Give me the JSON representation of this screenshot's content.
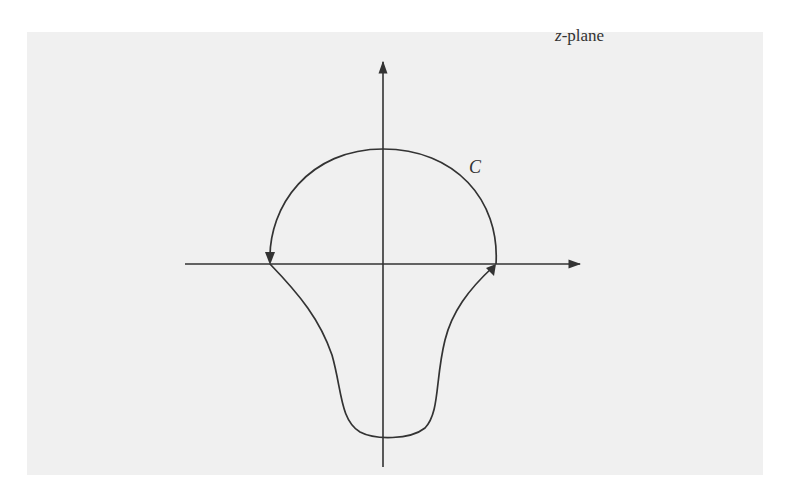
{
  "figure": {
    "plane_label_var": "z",
    "plane_label_suffix": "-plane",
    "curve_label": "C",
    "colors": {
      "background": "#ffffff",
      "panel": "#f0f0f0",
      "stroke": "#333333"
    },
    "axes": {
      "origin": [
        383,
        264
      ],
      "x_axis": {
        "from": [
          185,
          264
        ],
        "to": [
          582,
          264
        ],
        "arrow": "right"
      },
      "y_axis": {
        "from": [
          383,
          467
        ],
        "to": [
          383,
          60
        ],
        "arrow": "up"
      }
    },
    "contour": {
      "description": "Closed contour C: upper semicircular arc from right crossing (496,264) counterclockwise over the top to left crossing (270,264), then a lower teardrop-shaped lobe dipping to about y=437 and returning to the right crossing.",
      "left_crossing": [
        270,
        264
      ],
      "right_crossing": [
        496,
        264
      ],
      "top_point": [
        383,
        149
      ],
      "bottom_point": [
        383,
        437
      ],
      "arrows": [
        "down at left crossing (on arc)",
        "up-right at right crossing (on lower lobe)"
      ]
    }
  }
}
